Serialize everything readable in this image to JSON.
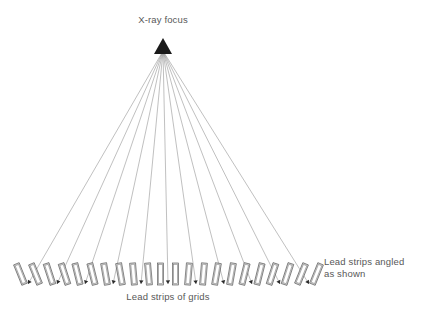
{
  "figure": {
    "background_color": "#ffffff",
    "width": 423,
    "height": 313
  },
  "labels": {
    "focus": "X-ray focus",
    "bottom_center": "Lead strips of grids",
    "right_line1": "Lead strips angled",
    "right_line2": "as shown"
  },
  "colors": {
    "ray_line": "#8c8c8c",
    "apex_fill": "#1a1a1a",
    "strip_fill": "#d9d9d9",
    "strip_stroke": "#4a4a4a",
    "text": "#585858",
    "background": "#ffffff"
  },
  "focus_point": {
    "x": 163,
    "y": 40,
    "apex_half_width": 9,
    "apex_height": 14
  },
  "geometry": {
    "strip_row_y_top": 262,
    "strip_row_y_bottom": 286,
    "strip_length": 22,
    "strip_width": 6,
    "ray_count": 11,
    "strips_per_group": 2
  },
  "chart_data": {
    "type": "diagram",
    "ray_groups": [
      {
        "index": 0,
        "group_center_x": 28,
        "tilt_deg": -22.0
      },
      {
        "index": 1,
        "group_center_x": 57,
        "tilt_deg": -18.0
      },
      {
        "index": 2,
        "group_center_x": 85,
        "tilt_deg": -14.0
      },
      {
        "index": 3,
        "group_center_x": 113,
        "tilt_deg": -10.0
      },
      {
        "index": 4,
        "group_center_x": 141,
        "tilt_deg": -5.0
      },
      {
        "index": 5,
        "group_center_x": 168,
        "tilt_deg": 0.0
      },
      {
        "index": 6,
        "group_center_x": 196,
        "tilt_deg": 5.0
      },
      {
        "index": 7,
        "group_center_x": 224,
        "tilt_deg": 10.0
      },
      {
        "index": 8,
        "group_center_x": 252,
        "tilt_deg": 14.0
      },
      {
        "index": 9,
        "group_center_x": 280,
        "tilt_deg": 18.0
      },
      {
        "index": 10,
        "group_center_x": 309,
        "tilt_deg": 22.0
      }
    ],
    "annotations": [
      {
        "text": "X-ray focus",
        "x": 163,
        "y": 23,
        "anchor": "middle"
      },
      {
        "text": "Lead strips of grids",
        "x": 168,
        "y": 300,
        "anchor": "middle"
      },
      {
        "text": "Lead strips angled",
        "x": 324,
        "y": 265,
        "anchor": "start"
      },
      {
        "text": "as shown",
        "x": 324,
        "y": 277,
        "anchor": "start"
      }
    ]
  }
}
